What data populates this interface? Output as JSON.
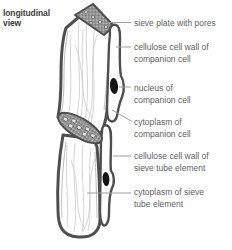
{
  "title": {
    "line1": "longitudinal",
    "line2": "view"
  },
  "labels": [
    {
      "line1": "sieve plate with pores",
      "line2": ""
    },
    {
      "line1": "cellulose cell wall of",
      "line2": "companion cell"
    },
    {
      "line1": "nucleus of",
      "line2": "companion cell"
    },
    {
      "line1": "cytoplasm of",
      "line2": "companion cell"
    },
    {
      "line1": "cellulose cell wall of",
      "line2": "sieve tube element"
    },
    {
      "line1": "cytoplasm of sieve",
      "line2": "tube element"
    }
  ],
  "diagram": {
    "parts": [
      "sieve-plate-with-pores-top",
      "sieve-plate-with-pores-junction",
      "sieve-tube-element-upper",
      "sieve-tube-element-lower",
      "companion-cell-upper",
      "companion-cell-lower",
      "nucleus-of-companion-cell-upper",
      "nucleus-of-companion-cell-lower",
      "cytoplasm-strands"
    ],
    "colors": {
      "cell_wall": "#4f4f4f",
      "sieve_plate_fill": "#969696",
      "nucleus": "#141414",
      "cytoplasm_strands": "#cacaca",
      "leader_line": "#9e9e9e",
      "label_text": "#5f5f5f",
      "title_text": "#3d3d3d",
      "background": "#ffffff"
    }
  }
}
